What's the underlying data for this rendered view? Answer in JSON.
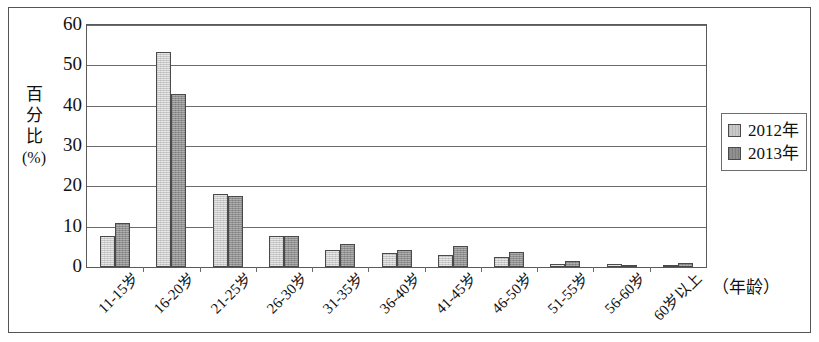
{
  "chart_data": {
    "type": "bar",
    "title": "",
    "subtitle": "",
    "xlabel": "（年龄）",
    "ylabel": "百分比(%)",
    "ylabel_chars": [
      "百",
      "分",
      "比"
    ],
    "ylabel_unit": "(%)",
    "ylim": [
      0,
      60
    ],
    "ytick_step": 10,
    "yticks": [
      60,
      50,
      40,
      30,
      20,
      10,
      0
    ],
    "grid": true,
    "grid_axis": "y",
    "legend_position": "right",
    "categories": [
      "11-15岁",
      "16-20岁",
      "21-25岁",
      "26-30岁",
      "31-35岁",
      "36-40岁",
      "41-45岁",
      "46-50岁",
      "51-55岁",
      "56-60岁",
      "60岁以上"
    ],
    "series": [
      {
        "name": "2012年",
        "color": "#c9c9c9",
        "values": [
          7.7,
          53.4,
          18.0,
          7.6,
          4.3,
          3.4,
          3.1,
          2.5,
          0.8,
          0.7,
          0.5
        ]
      },
      {
        "name": "2013年",
        "color": "#909090",
        "values": [
          11.0,
          42.8,
          17.6,
          7.7,
          5.7,
          4.2,
          5.2,
          3.7,
          1.5,
          0.6,
          1.1
        ]
      }
    ]
  },
  "legend": {
    "items": [
      {
        "label": "2012年",
        "swatch": "s2012"
      },
      {
        "label": "2013年",
        "swatch": "s2013"
      }
    ]
  }
}
